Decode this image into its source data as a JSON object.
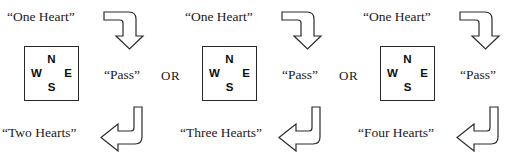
{
  "diagram": {
    "separator_label": "OR",
    "background_color": "#ffffff",
    "line_color": "#2b2b2b",
    "text_color": "#1a1a1a",
    "compass": {
      "north": "N",
      "west": "W",
      "east": "E",
      "south": "S"
    },
    "icons": {
      "top_arrow": "elbow-arrow-right-down-icon",
      "bottom_arrow": "elbow-arrow-down-left-icon"
    },
    "panels": [
      {
        "opening_bid": "“One Heart”",
        "response": "“Pass”",
        "final_contract": "“Two Hearts”"
      },
      {
        "opening_bid": "“One Heart”",
        "response": "“Pass”",
        "final_contract": "“Three Hearts”"
      },
      {
        "opening_bid": "“One Heart”",
        "response": "“Pass”",
        "final_contract": "“Four Hearts”"
      }
    ]
  }
}
